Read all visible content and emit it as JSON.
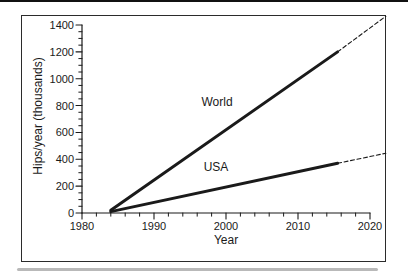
{
  "figure": {
    "background": "#ffffff",
    "border_color": "#2b2b2b",
    "ink_color": "#1a1a1a",
    "artifact_top_color": "#111111",
    "artifact_bottom_color": "#b9b9b9"
  },
  "chart_data": {
    "type": "line",
    "title": "",
    "xlabel": "Year",
    "ylabel": "Hips/year (thousands)",
    "xlim": [
      1980,
      2020
    ],
    "ylim": [
      0,
      1400
    ],
    "x_major_ticks": [
      1980,
      1990,
      2000,
      2010,
      2020
    ],
    "x_minor_step": 2,
    "y_major_ticks": [
      0,
      200,
      400,
      600,
      800,
      1000,
      1200,
      1400
    ],
    "y_minor_step": 50,
    "grid": false,
    "legend_position": "inline-labels-above-lines",
    "series": [
      {
        "name": "World",
        "label": "World",
        "color": "#1a1a1a",
        "solid_points": [
          [
            1984,
            20
          ],
          [
            2015.5,
            1200
          ]
        ],
        "dashed_projection_points": [
          [
            2015.5,
            1200
          ],
          [
            2022.2,
            1465
          ]
        ],
        "label_at": [
          1998.8,
          827
        ]
      },
      {
        "name": "USA",
        "label": "USA",
        "color": "#1a1a1a",
        "solid_points": [
          [
            1984,
            10
          ],
          [
            2015.5,
            370
          ]
        ],
        "dashed_projection_points": [
          [
            2015.5,
            370
          ],
          [
            2022.2,
            445
          ]
        ],
        "label_at": [
          1998.6,
          343
        ]
      }
    ]
  }
}
